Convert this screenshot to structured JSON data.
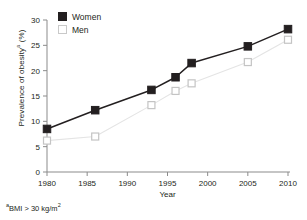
{
  "chart_data": {
    "type": "line",
    "title": "",
    "xlabel": "Year",
    "ylabel": "Prevalence of obesity",
    "ylabel_sup": "a",
    "ylabel_unit": "(%)",
    "footnote_sup": "a",
    "footnote": "BMI > 30 kg/m",
    "footnote_exp": "2",
    "xlim": [
      1980,
      2010
    ],
    "ylim": [
      0,
      30
    ],
    "xticks": [
      1980,
      1985,
      1990,
      1995,
      2000,
      2005,
      2010
    ],
    "yticks": [
      0,
      5,
      10,
      15,
      20,
      25,
      30
    ],
    "grid": false,
    "legend_position": "top-left",
    "series": [
      {
        "name": "Women",
        "marker": "filled-square",
        "color": "#231f20",
        "line_color": "#231f20",
        "x": [
          1980,
          1986,
          1993,
          1996,
          1998,
          2005,
          2010
        ],
        "values": [
          8.5,
          12.2,
          16.2,
          18.7,
          21.5,
          24.8,
          28.2
        ]
      },
      {
        "name": "Men",
        "marker": "open-square",
        "color": "#ffffff",
        "line_color": "#e4e4e4",
        "x": [
          1980,
          1986,
          1993,
          1996,
          1998,
          2005,
          2010
        ],
        "values": [
          6.2,
          7.0,
          13.2,
          16.0,
          17.5,
          21.7,
          26.1
        ]
      }
    ]
  },
  "legend": {
    "items": [
      {
        "label": "Women"
      },
      {
        "label": "Men"
      }
    ]
  },
  "axis": {
    "x_title": "Year",
    "y_title_main": "Prevalence of obesity",
    "y_title_sup": "a",
    "y_title_unit": " (%)"
  },
  "note": {
    "sup": "a",
    "text": "BMI > 30 kg/m",
    "exp": "2"
  }
}
